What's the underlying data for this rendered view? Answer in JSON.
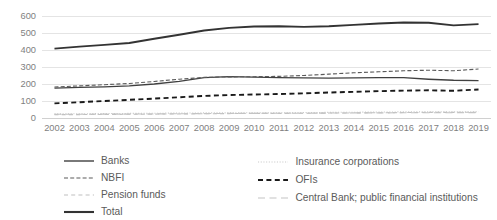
{
  "chart_data": {
    "type": "line",
    "title": "",
    "subtitle": "",
    "xlabel": "",
    "ylabel": "",
    "grid": "horizontal",
    "legend_position": "bottom",
    "ylim": [
      0,
      600
    ],
    "yticks": [
      0,
      100,
      200,
      300,
      400,
      500,
      600
    ],
    "categories": [
      "2002",
      "2003",
      "2004",
      "2005",
      "2006",
      "2007",
      "2008",
      "2009",
      "2010",
      "2011",
      "2012",
      "2013",
      "2014",
      "2015",
      "2016",
      "2017",
      "2018",
      "2019"
    ],
    "x": [
      "2002",
      "2003",
      "2004",
      "2005",
      "2006",
      "2007",
      "2008",
      "2009",
      "2010",
      "2011",
      "2012",
      "2013",
      "2014",
      "2015",
      "2016",
      "2017",
      "2018",
      "2019"
    ],
    "series": [
      {
        "name": "Banks",
        "style": "solid",
        "color": "#404040",
        "width": 1.3,
        "values": [
          176,
          180,
          183,
          189,
          200,
          215,
          238,
          243,
          241,
          238,
          236,
          235,
          236,
          238,
          237,
          228,
          222,
          220
        ]
      },
      {
        "name": "NBFI",
        "style": "dashed",
        "color": "#5a5a5a",
        "width": 1.1,
        "values": [
          182,
          189,
          196,
          203,
          215,
          228,
          239,
          242,
          243,
          245,
          250,
          258,
          266,
          272,
          278,
          281,
          278,
          288
        ]
      },
      {
        "name": "Pension funds",
        "style": "dash-light",
        "color": "#bfbfbf",
        "width": 1.1,
        "values": [
          20,
          20,
          21,
          22,
          23,
          24,
          25,
          26,
          27,
          27,
          28,
          29,
          30,
          31,
          32,
          33,
          33,
          34
        ]
      },
      {
        "name": "Total",
        "style": "solid-bold",
        "color": "#333333",
        "width": 1.9,
        "values": [
          408,
          420,
          430,
          441,
          466,
          490,
          515,
          530,
          538,
          540,
          536,
          540,
          548,
          556,
          562,
          560,
          545,
          552
        ]
      },
      {
        "name": "Insurance corporations",
        "style": "dotted",
        "color": "#c9c9c9",
        "width": 1.1,
        "values": [
          24,
          25,
          26,
          27,
          28,
          29,
          30,
          30,
          31,
          31,
          32,
          33,
          34,
          35,
          36,
          36,
          36,
          37
        ]
      },
      {
        "name": "OFIs",
        "style": "dashed-bold",
        "color": "#1a1a1a",
        "width": 1.9,
        "values": [
          86,
          93,
          100,
          107,
          114,
          122,
          130,
          135,
          138,
          141,
          145,
          150,
          154,
          158,
          161,
          163,
          160,
          168
        ]
      },
      {
        "name": "Central Bank; public financial institutions",
        "style": "longdash-light",
        "color": "#c4c4c4",
        "width": 1.1,
        "values": [
          22,
          22,
          23,
          23,
          24,
          25,
          26,
          27,
          27,
          28,
          28,
          29,
          30,
          30,
          31,
          31,
          31,
          32
        ]
      }
    ]
  },
  "legend": {
    "left_column": [
      {
        "label": "Banks",
        "style": "solid",
        "color": "#404040"
      },
      {
        "label": "NBFI",
        "style": "dashed",
        "color": "#5a5a5a"
      },
      {
        "label": "Pension funds",
        "style": "dash-light",
        "color": "#bfbfbf"
      },
      {
        "label": "Total",
        "style": "solid-bold",
        "color": "#333333"
      }
    ],
    "right_column": [
      {
        "label": "Insurance corporations",
        "style": "dotted",
        "color": "#c9c9c9"
      },
      {
        "label": "OFIs",
        "style": "dashed-bold",
        "color": "#1a1a1a"
      },
      {
        "label": "Central Bank; public financial institutions",
        "style": "longdash-light",
        "color": "#c4c4c4"
      }
    ]
  },
  "colors": {
    "gridline": "#e4e4e4",
    "tick_text": "#7f7f7f",
    "legend_text": "#5a5a5a",
    "background": "#ffffff"
  }
}
